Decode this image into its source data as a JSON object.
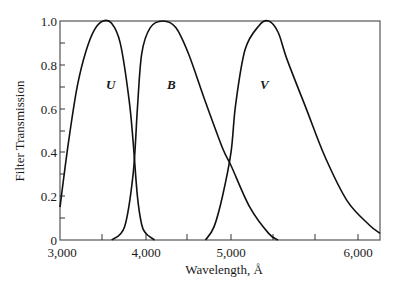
{
  "chart_data": {
    "type": "line",
    "title": "",
    "xlabel": "Wavelength, Å",
    "ylabel": "Filter Transmission",
    "xlim": [
      3000,
      6500
    ],
    "ylim": [
      0,
      1.0
    ],
    "grid": false,
    "legend": "inline labels",
    "x_ticks": [
      {
        "value": 3000,
        "label": "3,000",
        "px": 60
      },
      {
        "value": 4000,
        "label": "4,000",
        "px": 146
      },
      {
        "value": 5000,
        "label": "5,000",
        "px": 231
      },
      {
        "value": 6000,
        "label": "6,000",
        "px": 358
      }
    ],
    "x_minor_ticks_px": [
      102,
      187,
      273,
      315
    ],
    "y_ticks": [
      {
        "value": 0,
        "label": "0"
      },
      {
        "value": 0.2,
        "label": "0.2"
      },
      {
        "value": 0.4,
        "label": "0.4"
      },
      {
        "value": 0.6,
        "label": "0.6"
      },
      {
        "value": 0.8,
        "label": "0.8"
      },
      {
        "value": 1.0,
        "label": "1.0"
      }
    ],
    "series": [
      {
        "name": "U",
        "label_pos": {
          "x": 3650,
          "y": 0.78
        },
        "points": [
          [
            3000,
            0.15
          ],
          [
            3100,
            0.45
          ],
          [
            3200,
            0.7
          ],
          [
            3300,
            0.86
          ],
          [
            3400,
            0.96
          ],
          [
            3500,
            1.0
          ],
          [
            3600,
            0.99
          ],
          [
            3700,
            0.9
          ],
          [
            3800,
            0.65
          ],
          [
            3850,
            0.45
          ],
          [
            3900,
            0.2
          ],
          [
            3950,
            0.07
          ],
          [
            4000,
            0.03
          ],
          [
            4100,
            0.0
          ]
        ]
      },
      {
        "name": "B",
        "label_pos": {
          "x": 4300,
          "y": 0.78
        },
        "points": [
          [
            3600,
            0.0
          ],
          [
            3750,
            0.06
          ],
          [
            3850,
            0.3
          ],
          [
            3900,
            0.6
          ],
          [
            3950,
            0.85
          ],
          [
            4050,
            0.97
          ],
          [
            4200,
            1.0
          ],
          [
            4350,
            0.97
          ],
          [
            4500,
            0.85
          ],
          [
            4700,
            0.63
          ],
          [
            4900,
            0.42
          ],
          [
            5000,
            0.34
          ],
          [
            5200,
            0.15
          ],
          [
            5400,
            0.03
          ],
          [
            5500,
            0.0
          ]
        ]
      },
      {
        "name": "V",
        "label_pos": {
          "x": 5350,
          "y": 0.78
        },
        "points": [
          [
            4700,
            0.0
          ],
          [
            4800,
            0.06
          ],
          [
            4900,
            0.2
          ],
          [
            5000,
            0.4
          ],
          [
            5050,
            0.62
          ],
          [
            5150,
            0.87
          ],
          [
            5300,
            0.98
          ],
          [
            5400,
            1.0
          ],
          [
            5500,
            0.95
          ],
          [
            5600,
            0.82
          ],
          [
            5800,
            0.6
          ],
          [
            6000,
            0.38
          ],
          [
            6200,
            0.18
          ],
          [
            6400,
            0.07
          ],
          [
            6500,
            0.03
          ]
        ]
      }
    ]
  }
}
